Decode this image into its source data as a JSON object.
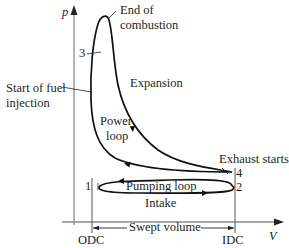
{
  "axes": {
    "y_label": "p",
    "x_label": "V"
  },
  "labels": {
    "end_of_combustion_line1": "End of",
    "end_of_combustion_line2": "combustion",
    "point_3": "3",
    "start_fuel_line1": "Start of fuel",
    "start_fuel_line2": "injection",
    "expansion": "Expansion",
    "power_loop_line1": "Power",
    "power_loop_line2": "loop",
    "exhaust_starts": "Exhaust starts",
    "point_4": "4",
    "point_2": "2",
    "point_1": "1",
    "pumping_loop": "Pumping loop",
    "intake": "Intake",
    "swept_volume": "Swept volume",
    "odc": "ODC",
    "idc": "IDC"
  },
  "colors": {
    "curve": "#111111",
    "axis": "#8a8a8a",
    "text": "#231f20"
  }
}
